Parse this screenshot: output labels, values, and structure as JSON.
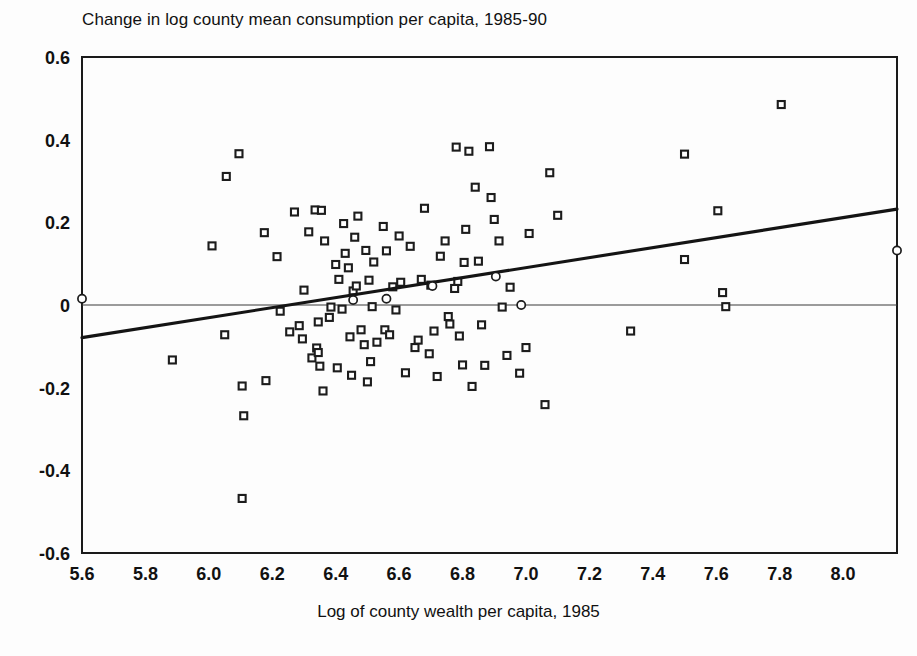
{
  "chart_data": {
    "type": "scatter",
    "title": "Change in log county mean consumption per capita, 1985-90",
    "xlabel": "Log of county wealth per capita, 1985",
    "ylabel": "",
    "xlim": [
      5.6,
      8.17
    ],
    "ylim": [
      -0.6,
      0.6
    ],
    "xticks": [
      "5.6",
      "5.8",
      "6.0",
      "6.2",
      "6.4",
      "6.6",
      "6.8",
      "7.0",
      "7.2",
      "7.4",
      "7.6",
      "7.8",
      "8.0"
    ],
    "xtick_values": [
      5.6,
      5.8,
      6.0,
      6.2,
      6.4,
      6.6,
      6.8,
      7.0,
      7.2,
      7.4,
      7.6,
      7.8,
      8.0
    ],
    "yticks": [
      "0.6",
      "0.4",
      "0.2",
      "0",
      "-0.2",
      "-0.4",
      "-0.6"
    ],
    "ytick_values": [
      0.6,
      0.4,
      0.2,
      0,
      -0.2,
      -0.4,
      -0.6
    ],
    "grid": false,
    "legend": null,
    "marker": "open-square",
    "reference_lines": [
      {
        "name": "zero-line",
        "orientation": "horizontal",
        "y": 0.0
      }
    ],
    "series": [
      {
        "name": "counties",
        "marker": "open-square",
        "points": [
          [
            5.885,
            -0.133
          ],
          [
            6.01,
            0.143
          ],
          [
            6.055,
            0.311
          ],
          [
            6.05,
            -0.072
          ],
          [
            6.095,
            0.366
          ],
          [
            6.105,
            -0.196
          ],
          [
            6.11,
            -0.268
          ],
          [
            6.105,
            -0.468
          ],
          [
            6.175,
            0.175
          ],
          [
            6.18,
            -0.183
          ],
          [
            6.215,
            0.117
          ],
          [
            6.225,
            -0.015
          ],
          [
            6.255,
            -0.065
          ],
          [
            6.27,
            0.225
          ],
          [
            6.285,
            -0.05
          ],
          [
            6.295,
            -0.082
          ],
          [
            6.3,
            0.036
          ],
          [
            6.315,
            0.177
          ],
          [
            6.325,
            -0.128
          ],
          [
            6.335,
            0.23
          ],
          [
            6.34,
            -0.104
          ],
          [
            6.345,
            -0.115
          ],
          [
            6.345,
            -0.041
          ],
          [
            6.35,
            -0.148
          ],
          [
            6.355,
            0.229
          ],
          [
            6.36,
            -0.208
          ],
          [
            6.365,
            0.155
          ],
          [
            6.38,
            -0.03
          ],
          [
            6.385,
            -0.005
          ],
          [
            6.4,
            0.098
          ],
          [
            6.405,
            -0.152
          ],
          [
            6.41,
            0.062
          ],
          [
            6.42,
            -0.01
          ],
          [
            6.425,
            0.197
          ],
          [
            6.43,
            0.125
          ],
          [
            6.44,
            0.09
          ],
          [
            6.445,
            -0.077
          ],
          [
            6.45,
            -0.17
          ],
          [
            6.455,
            0.034
          ],
          [
            6.46,
            0.164
          ],
          [
            6.465,
            0.046
          ],
          [
            6.47,
            0.215
          ],
          [
            6.48,
            -0.06
          ],
          [
            6.49,
            -0.096
          ],
          [
            6.495,
            0.132
          ],
          [
            6.5,
            -0.186
          ],
          [
            6.505,
            0.06
          ],
          [
            6.51,
            -0.137
          ],
          [
            6.515,
            -0.004
          ],
          [
            6.52,
            0.104
          ],
          [
            6.53,
            -0.09
          ],
          [
            6.55,
            0.19
          ],
          [
            6.555,
            -0.06
          ],
          [
            6.56,
            0.131
          ],
          [
            6.57,
            -0.072
          ],
          [
            6.58,
            0.044
          ],
          [
            6.59,
            -0.012
          ],
          [
            6.6,
            0.167
          ],
          [
            6.605,
            0.055
          ],
          [
            6.62,
            -0.164
          ],
          [
            6.635,
            0.142
          ],
          [
            6.65,
            -0.103
          ],
          [
            6.66,
            -0.085
          ],
          [
            6.67,
            0.062
          ],
          [
            6.68,
            0.234
          ],
          [
            6.695,
            -0.118
          ],
          [
            6.7,
            0.048
          ],
          [
            6.71,
            -0.063
          ],
          [
            6.72,
            -0.173
          ],
          [
            6.73,
            0.118
          ],
          [
            6.745,
            0.155
          ],
          [
            6.755,
            -0.028
          ],
          [
            6.76,
            -0.046
          ],
          [
            6.775,
            0.04
          ],
          [
            6.78,
            0.382
          ],
          [
            6.785,
            0.057
          ],
          [
            6.79,
            -0.075
          ],
          [
            6.8,
            -0.145
          ],
          [
            6.805,
            0.103
          ],
          [
            6.81,
            0.183
          ],
          [
            6.82,
            0.372
          ],
          [
            6.83,
            -0.197
          ],
          [
            6.84,
            0.285
          ],
          [
            6.85,
            0.106
          ],
          [
            6.86,
            -0.048
          ],
          [
            6.87,
            -0.146
          ],
          [
            6.885,
            0.383
          ],
          [
            6.89,
            0.26
          ],
          [
            6.9,
            0.207
          ],
          [
            6.915,
            0.155
          ],
          [
            6.925,
            -0.005
          ],
          [
            6.94,
            -0.122
          ],
          [
            6.95,
            0.043
          ],
          [
            6.98,
            -0.165
          ],
          [
            7.0,
            -0.103
          ],
          [
            7.01,
            0.173
          ],
          [
            7.06,
            -0.241
          ],
          [
            7.075,
            0.32
          ],
          [
            7.1,
            0.217
          ],
          [
            7.33,
            -0.063
          ],
          [
            7.5,
            0.365
          ],
          [
            7.5,
            0.11
          ],
          [
            7.605,
            0.228
          ],
          [
            7.62,
            0.03
          ],
          [
            7.63,
            -0.004
          ],
          [
            7.805,
            0.485
          ]
        ]
      }
    ],
    "fit_line": {
      "name": "regression-line",
      "x_start": 5.6,
      "y_start": -0.079,
      "x_end": 8.17,
      "y_end": 0.232
    },
    "fit_markers": {
      "name": "fitted-value-circles",
      "marker": "open-circle",
      "points": [
        [
          5.6,
          0.015
        ],
        [
          6.455,
          0.012
        ],
        [
          6.56,
          0.015
        ],
        [
          6.705,
          0.046
        ],
        [
          6.905,
          0.069
        ],
        [
          6.985,
          0.0
        ],
        [
          8.17,
          0.132
        ]
      ]
    }
  }
}
